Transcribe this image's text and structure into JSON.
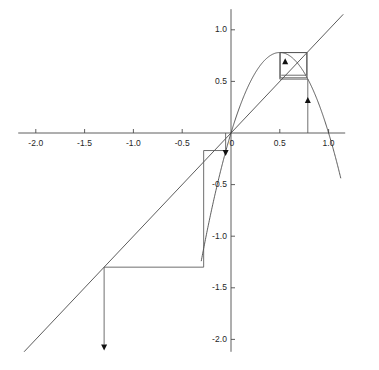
{
  "figure": {
    "name": "cobweb-diagram",
    "background": "#ffffff",
    "width": 379,
    "height": 370,
    "stroke_color": "#3f3f3f",
    "axis_color": "#4d4d4d",
    "cobweb_color": "#555555",
    "arrow_color": "#111111",
    "tick_font_size": "8.5px"
  },
  "axes": {
    "x": {
      "label": "",
      "ticks": [
        "-2.0",
        "-1.5",
        "-1.0",
        "-0.5",
        "0",
        "0.5",
        "1.0"
      ],
      "tick_values": [
        -2.0,
        -1.5,
        -1.0,
        -0.5,
        0,
        0.5,
        1.0
      ],
      "range": [
        -2.18,
        1.17
      ],
      "axis_y_value": 0
    },
    "y": {
      "label": "",
      "ticks": [
        "1.0",
        "0.5",
        "0",
        "-0.5",
        "-1.0",
        "-1.5",
        "-2.0"
      ],
      "tick_values": [
        1.0,
        0.5,
        0,
        -0.5,
        -1.0,
        -1.5,
        -2.0
      ],
      "range": [
        -2.12,
        1.2
      ],
      "axis_x_value": 0
    },
    "grid": false,
    "legend": false
  },
  "chart_data": {
    "type": "line",
    "title": "",
    "subtitle": "",
    "xlabel": "",
    "ylabel": "",
    "xlim": [
      -2.18,
      1.17
    ],
    "ylim": [
      -2.12,
      1.2
    ],
    "grid": false,
    "legend_position": "none",
    "annotations": [
      {
        "name": "arrowhead-up-upper-cobweb",
        "x": 0.555,
        "y": 0.665,
        "direction": "up"
      },
      {
        "name": "arrowhead-up-right-vertical",
        "x": 0.787,
        "y": 0.29,
        "direction": "up"
      },
      {
        "name": "arrowhead-down-near-origin",
        "x": -0.055,
        "y": -0.165,
        "direction": "down"
      },
      {
        "name": "arrowhead-down-lower-left",
        "x": -1.3,
        "y": -2.05,
        "direction": "down"
      }
    ],
    "series": [
      {
        "name": "logistic-map-parabola",
        "label": "f(x) = r x (1 - x)",
        "type": "line",
        "color": "#3f3f3f",
        "equation": {
          "form": "r*x*(1-x)",
          "r": 3.12
        },
        "x_domain": [
          -0.305,
          1.125
        ],
        "x": [
          -0.305,
          -0.28,
          -0.25,
          -0.22,
          -0.19,
          -0.16,
          -0.13,
          -0.1,
          -0.07,
          -0.04,
          -0.01,
          0.02,
          0.05,
          0.09,
          0.13,
          0.17,
          0.21,
          0.25,
          0.29,
          0.33,
          0.37,
          0.41,
          0.45,
          0.5,
          0.55,
          0.59,
          0.63,
          0.67,
          0.71,
          0.75,
          0.79,
          0.83,
          0.87,
          0.91,
          0.95,
          0.99,
          1.03,
          1.07,
          1.1,
          1.125
        ],
        "y": [
          -1.243,
          -1.118,
          -0.975,
          -0.838,
          -0.705,
          -0.579,
          -0.458,
          -0.343,
          -0.234,
          -0.13,
          -0.032,
          0.061,
          0.148,
          0.259,
          0.353,
          0.44,
          0.519,
          0.585,
          0.645,
          0.69,
          0.727,
          0.754,
          0.773,
          0.78,
          0.773,
          0.754,
          0.727,
          0.69,
          0.642,
          0.585,
          0.518,
          0.44,
          0.353,
          0.256,
          0.148,
          0.032,
          -0.097,
          -0.234,
          -0.343,
          -0.439
        ]
      },
      {
        "name": "identity-line",
        "label": "y = x",
        "type": "line",
        "color": "#3f3f3f",
        "equation": {
          "form": "x"
        },
        "x": [
          -2.12,
          1.15
        ],
        "y": [
          -2.12,
          1.15
        ]
      },
      {
        "name": "cobweb-orbit-upper",
        "label": "cobweb orbit converging to 2-cycle",
        "type": "cobweb",
        "color": "#555555",
        "path_x": [
          0.787,
          0.787,
          0.5,
          0.5,
          0.78,
          0.78,
          0.505,
          0.505,
          0.775,
          0.775,
          0.515
        ],
        "path_y": [
          0.0,
          0.522,
          0.522,
          0.78,
          0.78,
          0.535,
          0.535,
          0.779,
          0.779,
          0.56,
          0.56
        ],
        "start_x": 0.787,
        "cycle_points": [
          0.5,
          0.78
        ]
      },
      {
        "name": "cobweb-orbit-divergent",
        "label": "cobweb orbit escaping to -infinity",
        "type": "cobweb",
        "color": "#555555",
        "path_x": [
          -0.055,
          -0.055,
          -0.28,
          -0.28,
          -1.3,
          -1.3
        ],
        "path_y": [
          0.0,
          -0.17,
          -0.17,
          -1.3,
          -1.3,
          -2.05
        ],
        "start_x": -0.055
      }
    ]
  }
}
